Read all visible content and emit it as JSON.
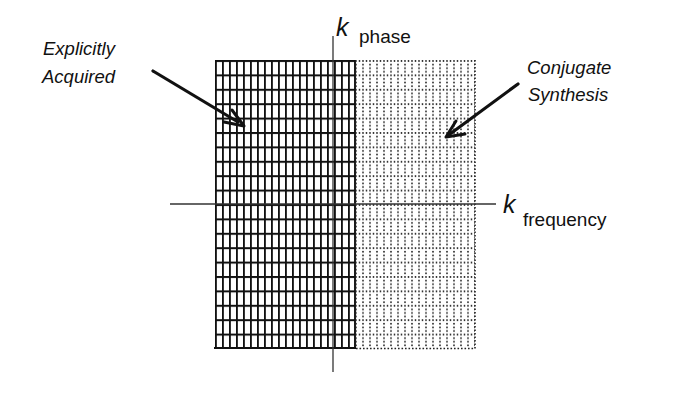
{
  "diagram": {
    "axes": {
      "vertical": {
        "symbol": "k",
        "subscript": "phase"
      },
      "horizontal": {
        "symbol": "k",
        "subscript": "frequency"
      }
    },
    "regions": [
      {
        "id": "acquired",
        "label_lines": [
          "Explicitly",
          "Acquired"
        ],
        "style": "solid-grid",
        "columns": 20,
        "rows": 20
      },
      {
        "id": "synthesized",
        "label_lines": [
          "Conjugate",
          "Synthesis"
        ],
        "style": "dotted-grid",
        "columns": 17,
        "rows": 20
      }
    ],
    "colors": {
      "ink": "#111111",
      "background": "#ffffff",
      "axis": "#333333"
    }
  }
}
